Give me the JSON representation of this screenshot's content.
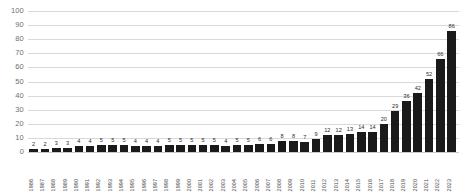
{
  "chart_data": {
    "type": "bar",
    "title": "",
    "subtitle": "",
    "xlabel": "",
    "ylabel": "",
    "ylim": [
      0,
      100
    ],
    "yticks": [
      0,
      10,
      20,
      30,
      40,
      50,
      60,
      70,
      80,
      90,
      100
    ],
    "ytick_labels": [
      "0",
      "10",
      "20",
      "30",
      "40",
      "50",
      "60",
      "70",
      "80",
      "90",
      "100"
    ],
    "grid": true,
    "legend": false,
    "legend_position": "none",
    "bar_color": "#1a1a1a",
    "grid_color": "#d9d9d9",
    "label_color": "#6f6f6f",
    "show_value_labels": true,
    "categories": [
      "1986",
      "1987",
      "1988",
      "1989",
      "1990",
      "1991",
      "1992",
      "1993",
      "1994",
      "1995",
      "1996",
      "1997",
      "1998",
      "1999",
      "2000",
      "2001",
      "2002",
      "2003",
      "2004",
      "2005",
      "2006",
      "2007",
      "2008",
      "2009",
      "2010",
      "2011",
      "2012",
      "2013",
      "2014",
      "2015",
      "2016",
      "2017",
      "2018",
      "2019",
      "2020",
      "2021",
      "2022",
      "2023"
    ],
    "values": [
      2,
      2,
      3,
      3,
      4,
      4,
      5,
      5,
      5,
      4,
      4,
      4,
      5,
      5,
      5,
      5,
      5,
      4,
      5,
      5,
      6,
      6,
      8,
      8,
      7,
      9,
      12,
      12,
      13,
      14,
      14,
      20,
      29,
      36,
      42,
      52,
      66,
      86
    ],
    "value_labels": [
      "2",
      "2",
      "3",
      "3",
      "4",
      "4",
      "5",
      "5",
      "5",
      "4",
      "4",
      "4",
      "5",
      "5",
      "5",
      "5",
      "5",
      "4",
      "5",
      "5",
      "6",
      "6",
      "8",
      "8",
      "7",
      "9",
      "12",
      "12",
      "13",
      "14",
      "14",
      "20",
      "29",
      "36",
      "42",
      "52",
      "66",
      "86"
    ]
  }
}
